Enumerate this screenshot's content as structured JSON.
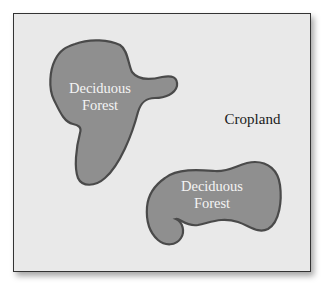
{
  "map": {
    "colors": {
      "background": "#e9e9e9",
      "forest_fill": "#8f8f8f",
      "forest_stroke": "#4a4a4a",
      "frame_border": "#333333"
    },
    "regions": [
      {
        "id": "forest-1",
        "type": "Deciduous Forest",
        "line1": "Deciduous",
        "line2": "Forest"
      },
      {
        "id": "cropland",
        "type": "Cropland",
        "label": "Cropland"
      },
      {
        "id": "forest-2",
        "type": "Deciduous Forest",
        "line1": "Deciduous",
        "line2": "Forest"
      }
    ]
  }
}
